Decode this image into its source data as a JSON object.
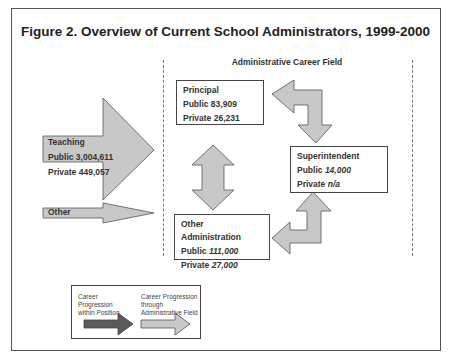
{
  "title": "Figure 2. Overview of Current School Administrators, 1999-2000",
  "field_label": "Administrative Career Field",
  "nodes": {
    "teaching": {
      "name": "Teaching",
      "public": "Public 3,004,611",
      "private": "Private 449,057"
    },
    "other": {
      "name": "Other"
    },
    "principal": {
      "name": "Principal",
      "public": "Public 83,909",
      "private": "Private 26,231"
    },
    "superintendent": {
      "name": "Superintendent",
      "public_label": "Public ",
      "public_value": "14,000",
      "private_label": "Private ",
      "private_value": "n/a"
    },
    "other_admin": {
      "name": "Other Administration",
      "public_label": "Public ",
      "public_value": "111,000",
      "private_label": "Private ",
      "private_value": "27,000"
    }
  },
  "legend": {
    "within_position": "Career Progression within Position",
    "through_field": "Career Progression through Administrative Field"
  },
  "colors": {
    "light_arrow": "#c8c8c8",
    "dark_arrow": "#5a5a5a",
    "border": "#555555"
  }
}
